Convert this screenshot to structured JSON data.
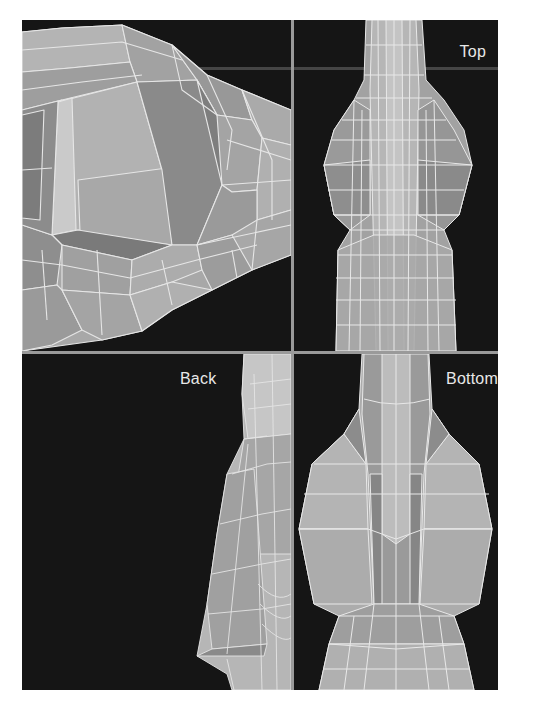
{
  "figure": {
    "type": "3d-modeling-four-viewport-render"
  },
  "viewports": [
    {
      "id": "perspective",
      "position": "top-left",
      "label": null
    },
    {
      "id": "top",
      "position": "top-right",
      "label": "Top"
    },
    {
      "id": "back",
      "position": "bottom-left",
      "label": "Back"
    },
    {
      "id": "bottom",
      "position": "bottom-right",
      "label": "Bottom"
    }
  ],
  "labels": {
    "top": "Top",
    "back": "Back",
    "bottom": "Bottom"
  },
  "colors": {
    "page_background": "#ffffff",
    "viewport_background": "#151515",
    "divider": "#9a9a9a",
    "mesh_light": "#b8b8b8",
    "mesh_mid": "#9c9c9c",
    "mesh_dark": "#7c7c7c",
    "edge_lines": "#e6e6e6",
    "label_text": "#e8e8e8"
  }
}
